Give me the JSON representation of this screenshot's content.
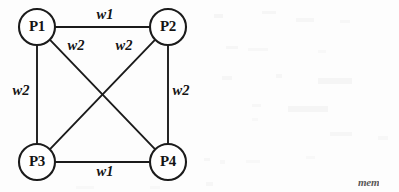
{
  "figure": {
    "type": "weighted-graph-diagram",
    "background_color": "#fdfdfd",
    "ink_color": "#1b1b1b",
    "nodes": [
      {
        "id": "P1",
        "label": "P1",
        "cx": 37,
        "cy": 27,
        "r": 18
      },
      {
        "id": "P2",
        "label": "P2",
        "cx": 168,
        "cy": 27,
        "r": 18
      },
      {
        "id": "P3",
        "label": "P3",
        "cx": 37,
        "cy": 162,
        "r": 18
      },
      {
        "id": "P4",
        "label": "P4",
        "cx": 168,
        "cy": 162,
        "r": 18
      }
    ],
    "edges": [
      {
        "id": "e-p1-p2",
        "from": "P1",
        "to": "P2",
        "weight": "w1",
        "label_x": 105,
        "label_y": 16
      },
      {
        "id": "e-p3-p4",
        "from": "P3",
        "to": "P4",
        "weight": "w1",
        "label_x": 105,
        "label_y": 173
      },
      {
        "id": "e-p1-p3",
        "from": "P1",
        "to": "P3",
        "weight": "w2",
        "label_x": 21,
        "label_y": 92
      },
      {
        "id": "e-p2-p4",
        "from": "P2",
        "to": "P4",
        "weight": "w2",
        "label_x": 181,
        "label_y": 92
      },
      {
        "id": "e-p1-p4",
        "from": "P1",
        "to": "P4",
        "weight": "w2",
        "label_x": 76,
        "label_y": 47
      },
      {
        "id": "e-p2-p3",
        "from": "P2",
        "to": "P3",
        "weight": "w2",
        "label_x": 124,
        "label_y": 47
      }
    ],
    "margin_artifact": {
      "text": "mem",
      "x": 358,
      "y": 176
    }
  }
}
